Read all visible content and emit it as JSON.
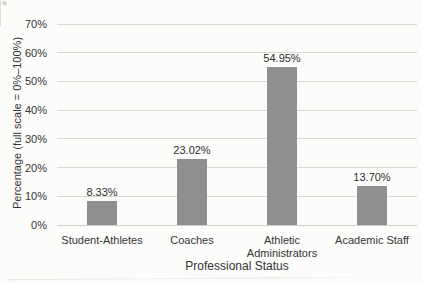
{
  "chart_data": {
    "type": "bar",
    "title": "",
    "categories": [
      "Student-Athletes",
      "Coaches",
      "Athletic Administrators",
      "Academic Staff"
    ],
    "values": [
      8.33,
      23.02,
      54.95,
      13.7
    ],
    "value_labels": [
      "8.33%",
      "23.02%",
      "54.95%",
      "13.70%"
    ],
    "xlabel": "Professional Status",
    "ylabel": "Percentage (full scale = 0%–1​00%)",
    "ylabel_display": "Percentage (full scale = 0%–100%)",
    "ylim": [
      0,
      70
    ],
    "ytick_values": [
      0,
      10,
      20,
      30,
      40,
      50,
      60,
      70
    ],
    "ytick_labels": [
      "0%",
      "10%",
      "20%",
      "30%",
      "40%",
      "50%",
      "60%",
      "70%"
    ],
    "grid": true,
    "legend": false,
    "bar_color": "#8d8f91",
    "gridline_color": "#d9d9d4",
    "text_color": "#343434",
    "background_color": "#fcfcfb"
  }
}
